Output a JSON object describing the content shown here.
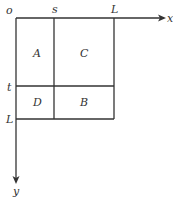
{
  "diagram": {
    "axes": {
      "origin_label": "o",
      "x_label": "x",
      "y_label": "y"
    },
    "x_ticks": [
      {
        "label": "s"
      },
      {
        "label": "L"
      }
    ],
    "y_ticks": [
      {
        "label": "t"
      },
      {
        "label": "L"
      }
    ],
    "regions": [
      {
        "label": "A"
      },
      {
        "label": "C"
      },
      {
        "label": "D"
      },
      {
        "label": "B"
      }
    ],
    "colors": {
      "line": "#333333",
      "background": "#ffffff"
    }
  }
}
